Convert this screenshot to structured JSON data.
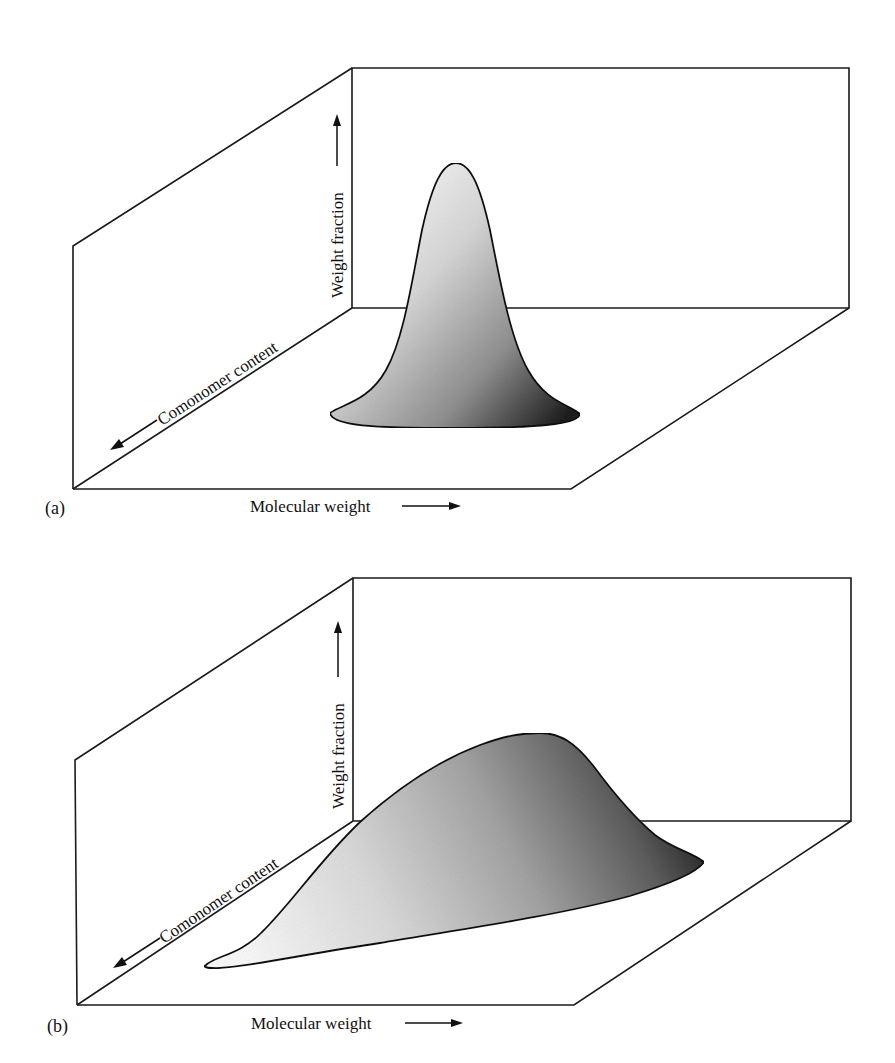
{
  "figure": {
    "panels": [
      {
        "id": "a",
        "label": "(a)",
        "axes": {
          "x_label": "Molecular weight",
          "y_label": "Weight fraction",
          "z_label": "Comonomer content"
        },
        "description": "Narrow, symmetric, tall peak — narrow molecular weight distribution and narrow comonomer content distribution"
      },
      {
        "id": "b",
        "label": "(b)",
        "axes": {
          "x_label": "Molecular weight",
          "y_label": "Weight fraction",
          "z_label": "Comonomer content"
        },
        "description": "Broad, skewed, lower peak — broad molecular weight distribution with comonomer content varying across molecular weight"
      }
    ],
    "colors": {
      "line": "#1a1a1a",
      "surface_light": "#f2f2f2",
      "surface_mid": "#a8a8a8",
      "surface_dark": "#2a2a2a",
      "background": "#ffffff"
    }
  }
}
